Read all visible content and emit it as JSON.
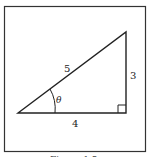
{
  "figure": {
    "frame_color": "#333333",
    "line_color": "#222222",
    "triangle": {
      "hypotenuse_label": "5",
      "opposite_label": "3",
      "adjacent_label": "4",
      "angle_label": "θ"
    },
    "caption": "Figure 1.5"
  }
}
